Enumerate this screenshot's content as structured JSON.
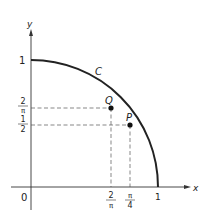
{
  "figure": {
    "axes": {
      "x_label": "x",
      "y_label": "y",
      "origin_label": "0"
    },
    "curve": {
      "label": "C",
      "description": "quarter circle arc from (0,1) to (1,0)"
    },
    "x_ticks": [
      {
        "num": "2",
        "den": "π",
        "value": 0.6366
      },
      {
        "num": "π",
        "den": "4",
        "value": 0.7854
      },
      {
        "label": "1",
        "value": 1
      }
    ],
    "y_ticks": [
      {
        "label": "1",
        "value": 1
      },
      {
        "num": "2",
        "den": "π",
        "value": 0.6366
      },
      {
        "num": "1",
        "den": "2",
        "value": 0.5
      }
    ],
    "points": [
      {
        "label": "Q",
        "x": "2/π",
        "y": "2/π"
      },
      {
        "label": "P",
        "x": "π/4",
        "y": "1/2"
      }
    ],
    "colors": {
      "stroke": "#222222",
      "dashed": "#555555",
      "background": "#ffffff"
    }
  }
}
